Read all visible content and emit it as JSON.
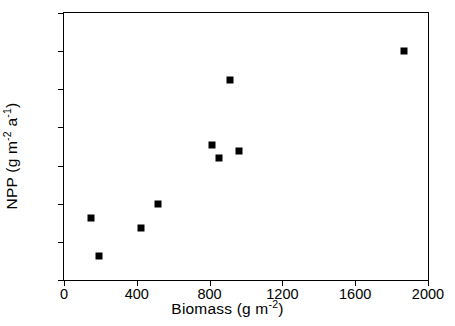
{
  "chart_data": {
    "type": "scatter",
    "title": "",
    "xlabel": "Biomass (g m-2)",
    "ylabel": "NPP (g m-2 a-1)",
    "xlabel_parts": {
      "base": "Biomass (g m",
      "sup1": "-2",
      "tail": ")"
    },
    "ylabel_parts": {
      "base": "NPP (g m",
      "sup1": "-2",
      "mid": " a",
      "sup2": "-1",
      "tail": ")"
    },
    "xlim": [
      0,
      2000
    ],
    "ylim": [
      0,
      350
    ],
    "xticks": [
      0,
      400,
      800,
      1200,
      1600,
      2000
    ],
    "yticks": [
      0,
      50,
      100,
      150,
      200,
      250,
      300,
      350
    ],
    "xtick_labels": [
      "0",
      "400",
      "800",
      "1200",
      "1600",
      "2000"
    ],
    "ytick_labels": [
      "0",
      "50",
      "100",
      "150",
      "200",
      "250",
      "300",
      "350"
    ],
    "grid": false,
    "legend": false,
    "marker": "filled-square",
    "marker_color": "#000000",
    "points": [
      {
        "x": 150,
        "y": 81
      },
      {
        "x": 190,
        "y": 32
      },
      {
        "x": 425,
        "y": 68
      },
      {
        "x": 515,
        "y": 99
      },
      {
        "x": 815,
        "y": 177
      },
      {
        "x": 850,
        "y": 160
      },
      {
        "x": 960,
        "y": 169
      },
      {
        "x": 910,
        "y": 262
      },
      {
        "x": 1870,
        "y": 300
      }
    ]
  }
}
